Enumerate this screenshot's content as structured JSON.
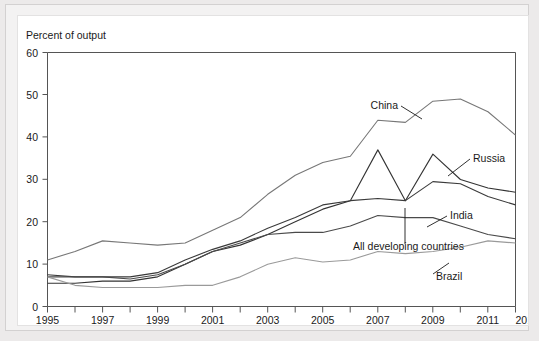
{
  "chart_data": {
    "type": "line",
    "title": "",
    "ylabel": "Percent of output",
    "xlabel": "",
    "ylim": [
      0,
      60
    ],
    "ytick_labels": [
      "0",
      "10",
      "20",
      "30",
      "40",
      "50",
      "60"
    ],
    "ytick_values": [
      0,
      10,
      20,
      30,
      40,
      50,
      60
    ],
    "xlim": [
      1995,
      2012
    ],
    "xtick_labels": [
      "1995",
      "1997",
      "1999",
      "2001",
      "2003",
      "2005",
      "2007",
      "2009",
      "2011",
      "2012"
    ],
    "xtick_values": [
      1995,
      1997,
      1999,
      2001,
      2003,
      2005,
      2007,
      2009,
      2011,
      2012
    ],
    "minor_xticks": [
      1996,
      1998,
      2000,
      2002,
      2004,
      2006,
      2008,
      2010
    ],
    "grid": false,
    "legend_position": "inline-annotations",
    "x": [
      1995,
      1996,
      1997,
      1998,
      1999,
      2000,
      2001,
      2002,
      2003,
      2004,
      2005,
      2006,
      2007,
      2008,
      2009,
      2010,
      2011,
      2012
    ],
    "series": [
      {
        "name": "China",
        "color": "#777777",
        "values": [
          11,
          13,
          15.5,
          15,
          14.5,
          15,
          18,
          21,
          26.5,
          31,
          34,
          35.5,
          44,
          43.5,
          48.5,
          49,
          46,
          40.5
        ]
      },
      {
        "name": "Russia",
        "color": "#333333",
        "values": [
          5.5,
          5.5,
          6,
          6,
          7,
          10,
          13,
          14.5,
          17,
          20,
          23,
          25,
          37,
          25,
          36,
          30,
          28,
          27
        ]
      },
      {
        "name": "India",
        "color": "#3a3a3a",
        "values": [
          7.5,
          7,
          7,
          7,
          8,
          11,
          13.5,
          15.5,
          18.5,
          21,
          24,
          25,
          25.5,
          25,
          29.5,
          29,
          26,
          24
        ]
      },
      {
        "name": "All developing countries",
        "color": "#4a4a4a",
        "values": [
          7,
          7,
          7,
          6.5,
          7.5,
          10,
          13,
          15,
          17,
          17.5,
          17.5,
          19,
          21.5,
          21,
          21,
          19,
          17,
          16
        ]
      },
      {
        "name": "Brazil",
        "color": "#9a9a9a",
        "values": [
          7,
          5,
          4.5,
          4.5,
          4.5,
          5,
          5,
          7,
          10,
          11.5,
          10.5,
          11,
          13,
          12.5,
          13,
          14,
          15.5,
          15
        ]
      }
    ],
    "annotations": [
      {
        "text": "China",
        "x": 380,
        "y": 93,
        "anchor": "end"
      },
      {
        "text": "Russia",
        "x": 455,
        "y": 146,
        "anchor": "start"
      },
      {
        "text": "India",
        "x": 432,
        "y": 203,
        "anchor": "start"
      },
      {
        "text": "All developing countries",
        "x": 335,
        "y": 234,
        "anchor": "start"
      },
      {
        "text": "Brazil",
        "x": 418,
        "y": 264,
        "anchor": "start"
      }
    ]
  }
}
